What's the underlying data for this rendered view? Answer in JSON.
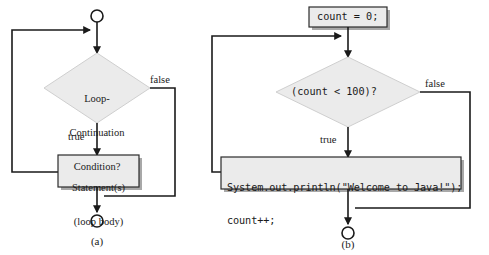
{
  "figure": {
    "background_color": "#ffffff",
    "shape_fill": "#ebebeb",
    "shape_stroke": "#2b2b2b",
    "shadow_color": "#a8a8a8",
    "line_color": "#1a1a1a"
  },
  "panel_a": {
    "caption": "(a)",
    "start_node": "start-circle",
    "decision": {
      "line1": "Loop-",
      "line2": "Continuation",
      "line3": "Condition?"
    },
    "edge_true": "true",
    "edge_false": "false",
    "process": {
      "line1": "Statement(s)",
      "line2": "(loop body)"
    },
    "end_node": "end-circle"
  },
  "panel_b": {
    "caption": "(b)",
    "init_box": "count = 0;",
    "decision": "(count < 100)?",
    "edge_true": "true",
    "edge_false": "false",
    "process": {
      "line1": "System.out.println(\"Welcome to Java!\");",
      "line2": "count++;"
    },
    "end_node": "end-circle"
  }
}
